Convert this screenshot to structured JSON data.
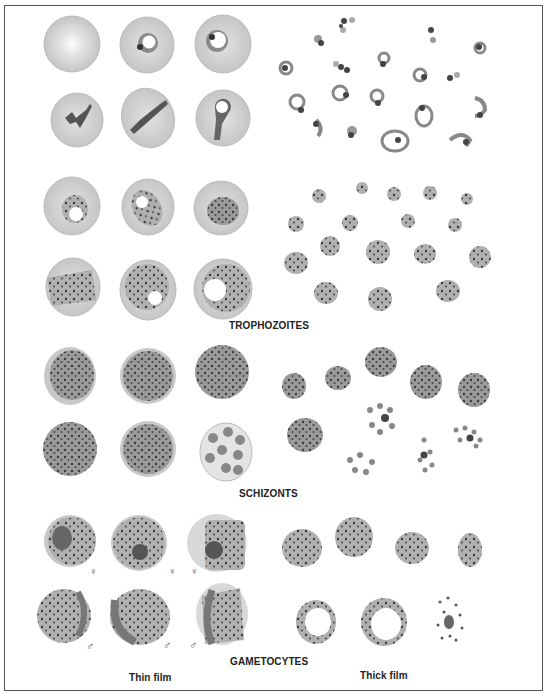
{
  "plate": {
    "sections": [
      {
        "id": "trophozoites",
        "label": "TROPHOZOITES"
      },
      {
        "id": "schizonts",
        "label": "SCHIZONTS"
      },
      {
        "id": "gametocytes",
        "label": "GAMETOCYTES"
      }
    ],
    "columns": {
      "left": "Thin film",
      "right": "Thick film"
    },
    "symbols": {
      "female": "♀",
      "male": "♂"
    },
    "colors": {
      "cell": "#d2d2d2",
      "cell_edge": "#b8b8b8",
      "parasite": "#7a7a7a",
      "chromatin": "#333333",
      "frame": "#555555"
    }
  }
}
